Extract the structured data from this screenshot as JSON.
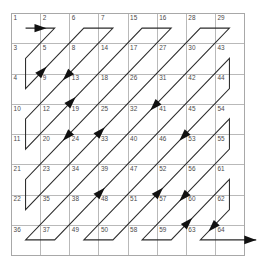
{
  "figure": {
    "grid": {
      "rows": 8,
      "cols": 8,
      "x": 11,
      "y": 13,
      "cell_width": 29.125,
      "cell_height": 30.25,
      "line_color": "#b9b9b9",
      "border_color": "#a8a8a8"
    },
    "path": {
      "color": "#2b2b2b",
      "arrow_color": "#111111",
      "start_index": 1,
      "end_index": 64
    },
    "cells": [
      [
        1,
        2,
        6,
        7,
        15,
        16,
        28,
        29
      ],
      [
        3,
        5,
        8,
        14,
        17,
        27,
        30,
        43
      ],
      [
        4,
        9,
        13,
        18,
        26,
        31,
        42,
        44
      ],
      [
        10,
        12,
        19,
        25,
        32,
        41,
        45,
        54
      ],
      [
        11,
        20,
        24,
        33,
        40,
        46,
        53,
        55
      ],
      [
        21,
        23,
        34,
        39,
        47,
        52,
        56,
        61
      ],
      [
        22,
        35,
        38,
        48,
        51,
        57,
        60,
        62
      ],
      [
        36,
        37,
        49,
        50,
        58,
        59,
        63,
        64
      ]
    ],
    "order": [
      {
        "n": 1,
        "r": 0,
        "c": 0
      },
      {
        "n": 2,
        "r": 0,
        "c": 1
      },
      {
        "n": 3,
        "r": 1,
        "c": 0
      },
      {
        "n": 4,
        "r": 2,
        "c": 0
      },
      {
        "n": 5,
        "r": 1,
        "c": 1
      },
      {
        "n": 6,
        "r": 0,
        "c": 2
      },
      {
        "n": 7,
        "r": 0,
        "c": 3
      },
      {
        "n": 8,
        "r": 1,
        "c": 2
      },
      {
        "n": 9,
        "r": 2,
        "c": 1
      },
      {
        "n": 10,
        "r": 3,
        "c": 0
      },
      {
        "n": 11,
        "r": 4,
        "c": 0
      },
      {
        "n": 12,
        "r": 3,
        "c": 1
      },
      {
        "n": 13,
        "r": 2,
        "c": 2
      },
      {
        "n": 14,
        "r": 1,
        "c": 3
      },
      {
        "n": 15,
        "r": 0,
        "c": 4
      },
      {
        "n": 16,
        "r": 0,
        "c": 5
      },
      {
        "n": 17,
        "r": 1,
        "c": 4
      },
      {
        "n": 18,
        "r": 2,
        "c": 3
      },
      {
        "n": 19,
        "r": 3,
        "c": 2
      },
      {
        "n": 20,
        "r": 4,
        "c": 1
      },
      {
        "n": 21,
        "r": 5,
        "c": 0
      },
      {
        "n": 22,
        "r": 6,
        "c": 0
      },
      {
        "n": 23,
        "r": 5,
        "c": 1
      },
      {
        "n": 24,
        "r": 4,
        "c": 2
      },
      {
        "n": 25,
        "r": 3,
        "c": 3
      },
      {
        "n": 26,
        "r": 2,
        "c": 4
      },
      {
        "n": 27,
        "r": 1,
        "c": 5
      },
      {
        "n": 28,
        "r": 0,
        "c": 6
      },
      {
        "n": 29,
        "r": 0,
        "c": 7
      },
      {
        "n": 30,
        "r": 1,
        "c": 6
      },
      {
        "n": 31,
        "r": 2,
        "c": 5
      },
      {
        "n": 32,
        "r": 3,
        "c": 4
      },
      {
        "n": 33,
        "r": 4,
        "c": 3
      },
      {
        "n": 34,
        "r": 5,
        "c": 2
      },
      {
        "n": 35,
        "r": 6,
        "c": 1
      },
      {
        "n": 36,
        "r": 7,
        "c": 0
      },
      {
        "n": 37,
        "r": 7,
        "c": 1
      },
      {
        "n": 38,
        "r": 6,
        "c": 2
      },
      {
        "n": 39,
        "r": 5,
        "c": 3
      },
      {
        "n": 40,
        "r": 4,
        "c": 4
      },
      {
        "n": 41,
        "r": 3,
        "c": 5
      },
      {
        "n": 42,
        "r": 2,
        "c": 6
      },
      {
        "n": 43,
        "r": 1,
        "c": 7
      },
      {
        "n": 44,
        "r": 2,
        "c": 7
      },
      {
        "n": 45,
        "r": 3,
        "c": 6
      },
      {
        "n": 46,
        "r": 4,
        "c": 5
      },
      {
        "n": 47,
        "r": 5,
        "c": 4
      },
      {
        "n": 48,
        "r": 6,
        "c": 3
      },
      {
        "n": 49,
        "r": 7,
        "c": 2
      },
      {
        "n": 50,
        "r": 7,
        "c": 3
      },
      {
        "n": 51,
        "r": 6,
        "c": 4
      },
      {
        "n": 52,
        "r": 5,
        "c": 5
      },
      {
        "n": 53,
        "r": 4,
        "c": 6
      },
      {
        "n": 54,
        "r": 3,
        "c": 7
      },
      {
        "n": 55,
        "r": 4,
        "c": 7
      },
      {
        "n": 56,
        "r": 5,
        "c": 6
      },
      {
        "n": 57,
        "r": 6,
        "c": 5
      },
      {
        "n": 58,
        "r": 7,
        "c": 4
      },
      {
        "n": 59,
        "r": 7,
        "c": 5
      },
      {
        "n": 60,
        "r": 6,
        "c": 6
      },
      {
        "n": 61,
        "r": 5,
        "c": 7
      },
      {
        "n": 62,
        "r": 6,
        "c": 7
      },
      {
        "n": 63,
        "r": 7,
        "c": 6
      },
      {
        "n": 64,
        "r": 7,
        "c": 7
      }
    ],
    "arrow_segments": [
      2,
      5,
      9,
      13,
      20,
      25,
      32,
      39,
      46,
      52,
      57,
      60,
      63
    ]
  }
}
